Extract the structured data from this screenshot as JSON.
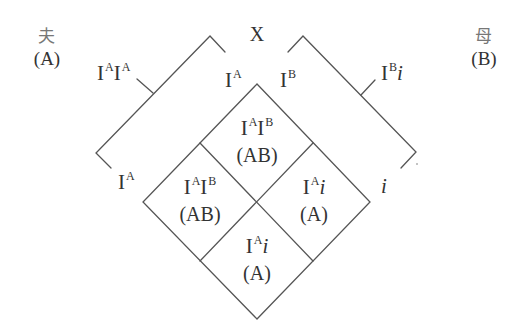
{
  "diagram": {
    "type": "punnett-diamond",
    "colors": {
      "line": "#555555",
      "text": "#333333",
      "background": "#ffffff"
    },
    "cross_symbol": "X",
    "father": {
      "label": "夫",
      "phenotype": "(A)",
      "genotype": {
        "base": "I",
        "sup1": "A",
        "base2": "I",
        "sup2": "A"
      }
    },
    "mother": {
      "label": "母",
      "phenotype": "(B)",
      "genotype": {
        "base": "I",
        "sup1": "B",
        "allele2": "i"
      }
    },
    "gametes": {
      "father_top": {
        "base": "I",
        "sup": "A"
      },
      "father_bottom": {
        "base": "I",
        "sup": "A"
      },
      "mother_top": {
        "base": "I",
        "sup": "B"
      },
      "mother_bottom": {
        "allele": "i"
      }
    },
    "offspring": [
      {
        "position": "top",
        "genotype": {
          "base": "I",
          "sup1": "A",
          "base2": "I",
          "sup2": "B"
        },
        "phenotype": "(AB)"
      },
      {
        "position": "left",
        "genotype": {
          "base": "I",
          "sup1": "A",
          "base2": "I",
          "sup2": "B"
        },
        "phenotype": "(AB)"
      },
      {
        "position": "right",
        "genotype": {
          "base": "I",
          "sup1": "A",
          "allele2": "i"
        },
        "phenotype": "(A)"
      },
      {
        "position": "bottom",
        "genotype": {
          "base": "I",
          "sup1": "A",
          "allele2": "i"
        },
        "phenotype": "(A)"
      }
    ]
  }
}
